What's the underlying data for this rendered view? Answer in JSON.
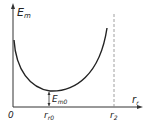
{
  "diagram": {
    "type": "energy-curve",
    "y_axis_label": "E",
    "y_axis_sub": "m",
    "x_axis_label": "r",
    "x_axis_sub": "r",
    "origin_label": "0",
    "min_x_label": "r",
    "min_x_sub": "r0",
    "limit_label": "r",
    "limit_sub": "2",
    "min_energy_label": "E",
    "min_energy_sub": "m0",
    "colors": {
      "line": "#222222",
      "dash": "#888888"
    }
  }
}
